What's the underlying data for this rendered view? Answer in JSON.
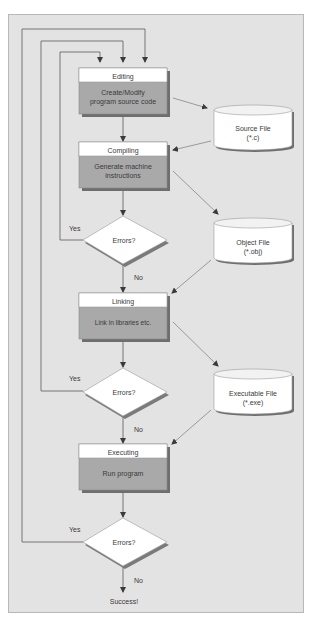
{
  "diagram": {
    "type": "flowchart",
    "title": "",
    "colors": {
      "background": "#e3e3e3",
      "frame_border": "#b8b8b8",
      "box_header": "#ffffff",
      "box_body": "#a9a9a9",
      "box_shadow": "#6e6e6e",
      "line": "#6a6a6a",
      "text": "#3a3a3a"
    },
    "process_boxes": [
      {
        "id": "editing",
        "title": "Editing",
        "body_lines": [
          "Create/Modify",
          "program source code"
        ]
      },
      {
        "id": "compiling",
        "title": "Compiling",
        "body_lines": [
          "Generate machine",
          "instructions"
        ]
      },
      {
        "id": "linking",
        "title": "Linking",
        "body_lines": [
          "Link in libraries etc."
        ]
      },
      {
        "id": "executing",
        "title": "Executing",
        "body_lines": [
          "Run program"
        ]
      }
    ],
    "decisions": [
      {
        "id": "errors1",
        "label": "Errors?",
        "yes": "Yes",
        "no": "No"
      },
      {
        "id": "errors2",
        "label": "Errors?",
        "yes": "Yes",
        "no": "No"
      },
      {
        "id": "errors3",
        "label": "Errors?",
        "yes": "Yes",
        "no": "No"
      }
    ],
    "files": [
      {
        "id": "source",
        "lines": [
          "Source File",
          "(*.c)"
        ]
      },
      {
        "id": "object",
        "lines": [
          "Object File",
          "(*.obj)"
        ]
      },
      {
        "id": "executable",
        "lines": [
          "Executable File",
          "(*.exe)"
        ]
      }
    ],
    "terminal": {
      "label": "Success!"
    },
    "edges": [
      {
        "from": "editing",
        "to": "compiling"
      },
      {
        "from": "editing",
        "to": "source"
      },
      {
        "from": "source",
        "to": "compiling"
      },
      {
        "from": "compiling",
        "to": "errors1"
      },
      {
        "from": "compiling",
        "to": "object"
      },
      {
        "from": "errors1",
        "to": "editing",
        "label": "Yes"
      },
      {
        "from": "errors1",
        "to": "linking",
        "label": "No"
      },
      {
        "from": "object",
        "to": "linking"
      },
      {
        "from": "linking",
        "to": "errors2"
      },
      {
        "from": "linking",
        "to": "executable"
      },
      {
        "from": "errors2",
        "to": "editing",
        "label": "Yes"
      },
      {
        "from": "errors2",
        "to": "executing",
        "label": "No"
      },
      {
        "from": "executable",
        "to": "executing"
      },
      {
        "from": "executing",
        "to": "errors3"
      },
      {
        "from": "errors3",
        "to": "editing",
        "label": "Yes"
      },
      {
        "from": "errors3",
        "to": "terminal",
        "label": "No"
      }
    ]
  }
}
